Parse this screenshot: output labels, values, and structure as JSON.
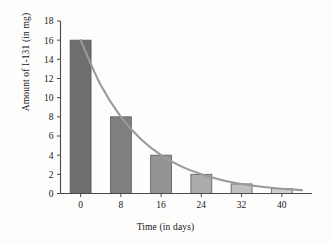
{
  "chart_data": {
    "type": "bar",
    "title": "",
    "subtitle": "",
    "xlabel": "Time (in days)",
    "ylabel": "Amount of I-131 (in mg)",
    "categories": [
      "0",
      "8",
      "16",
      "24",
      "32",
      "40"
    ],
    "x": [
      0,
      8,
      16,
      24,
      32,
      40
    ],
    "values": [
      16,
      8,
      4,
      2,
      1,
      0.5
    ],
    "series": [
      {
        "name": "Amount of I-131 (in mg)",
        "values": [
          16,
          8,
          4,
          2,
          1,
          0.5
        ]
      }
    ],
    "overlay_curve": {
      "type": "line",
      "name": "exponential decay",
      "description": "smooth exponential decay curve through the bar tops",
      "model": "y = 16 * (0.5)^(t/8)",
      "color": "#9a9a9a",
      "points": [
        {
          "x": 0,
          "y": 16
        },
        {
          "x": 4,
          "y": 11.31
        },
        {
          "x": 8,
          "y": 8
        },
        {
          "x": 12,
          "y": 5.66
        },
        {
          "x": 16,
          "y": 4
        },
        {
          "x": 20,
          "y": 2.83
        },
        {
          "x": 24,
          "y": 2
        },
        {
          "x": 28,
          "y": 1.41
        },
        {
          "x": 32,
          "y": 1
        },
        {
          "x": 36,
          "y": 0.71
        },
        {
          "x": 40,
          "y": 0.5
        },
        {
          "x": 44,
          "y": 0.35
        }
      ]
    },
    "ylim": [
      0,
      18
    ],
    "xlim": [
      -4,
      46
    ],
    "yticks": [
      0,
      2,
      4,
      6,
      8,
      10,
      12,
      14,
      16,
      18
    ],
    "ytick_labels": [
      "0",
      "2",
      "4",
      "6",
      "8",
      "10",
      "12",
      "14",
      "16",
      "18"
    ],
    "xticks": [
      0,
      8,
      16,
      24,
      32,
      40
    ],
    "xtick_labels": [
      "0",
      "8",
      "16",
      "24",
      "32",
      "40"
    ],
    "grid": false,
    "legend": "none",
    "bar_colors": [
      "#6e6e6e",
      "#7f7f7f",
      "#949494",
      "#ababab",
      "#bfbfbf",
      "#cfcfcf"
    ],
    "bar_edge_color": "#5a5a5a",
    "axis_color": "#4a4a4a",
    "background_color": "#fdfdfc"
  }
}
